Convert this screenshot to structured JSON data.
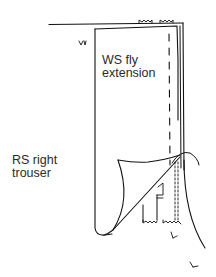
{
  "diagram": {
    "type": "sewing-instruction-illustration",
    "labels": {
      "ws_fly_extension": {
        "line1": "WS fly",
        "line2": "extension"
      },
      "rs_right_trouser": {
        "line1": "RS right",
        "line2": "trouser"
      }
    },
    "markers": {
      "notch_mark": "v",
      "grain_marks": [
        "/-",
        "/-"
      ]
    },
    "colors": {
      "ink": "#111111",
      "paper": "#ffffff"
    }
  }
}
